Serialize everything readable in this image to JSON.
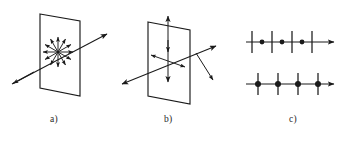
{
  "figure": {
    "background_color": "#ffffff",
    "stroke_color": "#1a1a1a",
    "panel_labels": {
      "a": "a)",
      "b": "b)",
      "c": "c)"
    },
    "caption": "",
    "panels": [
      {
        "id": "a",
        "label": "a)",
        "name": "unpolarized-light-panel",
        "description": "Plane drawn in perspective with a ray passing through it; a radial starburst of double-headed arrows at the intersection point indicates unpolarized light with all transverse vibration directions equally present.",
        "plane": {
          "shape": "parallelogram",
          "points": "40,14 80,21 80,96 40,88"
        },
        "ray": {
          "start": "12,82",
          "end": "108,35",
          "arrowheads": [
            "end"
          ]
        },
        "starburst": {
          "center_x": 58,
          "center_y": 52,
          "ray_count": 12,
          "radius": 16,
          "arrowheads": "outward"
        }
      },
      {
        "id": "b",
        "label": "b)",
        "name": "partially-polarized-light-panel",
        "description": "Plane drawn in perspective with a ray passing through it; a long vertical double-headed arrow plus shorter horizontal/oblique double-headed arrows indicate a preferred vibration direction (partial polarization).",
        "plane": {
          "shape": "parallelogram",
          "points": "148,22 190,30 190,104 148,96"
        },
        "ray": {
          "start": "120,84",
          "end": "218,45",
          "arrowheads": [
            "start",
            "end"
          ]
        },
        "vertical_arrow": {
          "top": "168,16",
          "bottom": "168,82",
          "arrowheads": [
            "start",
            "end",
            "middle"
          ]
        },
        "oblique_arrows": [
          {
            "start": "168,60",
            "end": "150,54",
            "arrowheads": [
              "end"
            ]
          },
          {
            "start": "168,60",
            "end": "186,67",
            "arrowheads": [
              "end"
            ]
          },
          {
            "start": "196,52",
            "end": "214,80",
            "arrowheads": [
              "end"
            ]
          }
        ]
      },
      {
        "id": "c",
        "label": "c)",
        "name": "polarization-symbol-lines-panel",
        "description": "Two horizontal propagation axes drawn as arrows. The upper axis carries alternating vertical tick marks and dots (partially polarized); the lower axis carries vertical tick marks with a dot at every tick (unpolarized / equal mixture).",
        "lines": [
          {
            "id": "c-top",
            "name": "upper-axis",
            "axis_y": 42,
            "x_start": 246,
            "x_end": 336,
            "arrowhead": "end",
            "ticks_x": [
              252,
              272,
              292,
              312
            ],
            "dots_x": [
              262,
              282,
              302
            ],
            "tick_height": 22,
            "dot_radius": 2.4,
            "tick_count": 4,
            "dot_count": 3
          },
          {
            "id": "c-bottom",
            "name": "lower-axis",
            "axis_y": 84,
            "x_start": 246,
            "x_end": 336,
            "arrowhead": "end",
            "ticks_x": [
              258,
              278,
              298,
              318
            ],
            "dots_x": [
              258,
              278,
              298,
              318
            ],
            "tick_height": 22,
            "dot_radius": 3.0,
            "tick_count": 4,
            "dot_count": 4
          }
        ]
      }
    ]
  }
}
